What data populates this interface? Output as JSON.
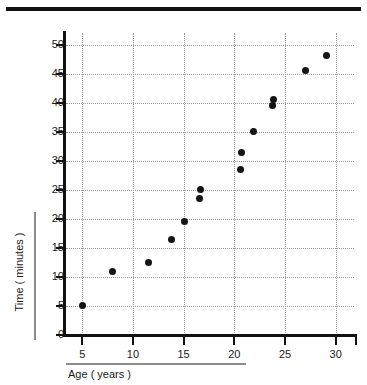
{
  "figure": {
    "top_rule_color": "#111111",
    "background_color": "#ffffff",
    "point_color": "#151515",
    "grid_color": "#9a9a9a",
    "axis_color": "#111111"
  },
  "chart_data": {
    "type": "scatter",
    "title": "",
    "xlabel": "Age ( years )",
    "ylabel": "Time ( minutes )",
    "xlim": [
      3.4,
      31.8
    ],
    "ylim": [
      0,
      52
    ],
    "xticks": [
      5,
      10,
      15,
      20,
      25,
      30
    ],
    "yticks": [
      0,
      5,
      10,
      15,
      20,
      25,
      30,
      35,
      40,
      45,
      50
    ],
    "xtick_labels": [
      "5",
      "10",
      "15",
      "20",
      "25",
      "30"
    ],
    "ytick_labels": [
      "0",
      "5",
      "10",
      "15",
      "20",
      "25",
      "30",
      "35",
      "40",
      "45",
      "50"
    ],
    "grid": true,
    "grid_style": "dotted",
    "legend": false,
    "marker": "filled-circle",
    "points": [
      {
        "x": 5.0,
        "y": 5.0
      },
      {
        "x": 8.0,
        "y": 11.0
      },
      {
        "x": 11.5,
        "y": 12.5
      },
      {
        "x": 13.8,
        "y": 16.5
      },
      {
        "x": 15.1,
        "y": 19.5
      },
      {
        "x": 16.6,
        "y": 23.5
      },
      {
        "x": 16.7,
        "y": 25.0
      },
      {
        "x": 20.6,
        "y": 28.5
      },
      {
        "x": 20.7,
        "y": 31.5
      },
      {
        "x": 21.9,
        "y": 35.0
      },
      {
        "x": 23.8,
        "y": 39.5
      },
      {
        "x": 23.9,
        "y": 40.6
      },
      {
        "x": 27.0,
        "y": 45.5
      },
      {
        "x": 29.1,
        "y": 48.2
      }
    ]
  }
}
